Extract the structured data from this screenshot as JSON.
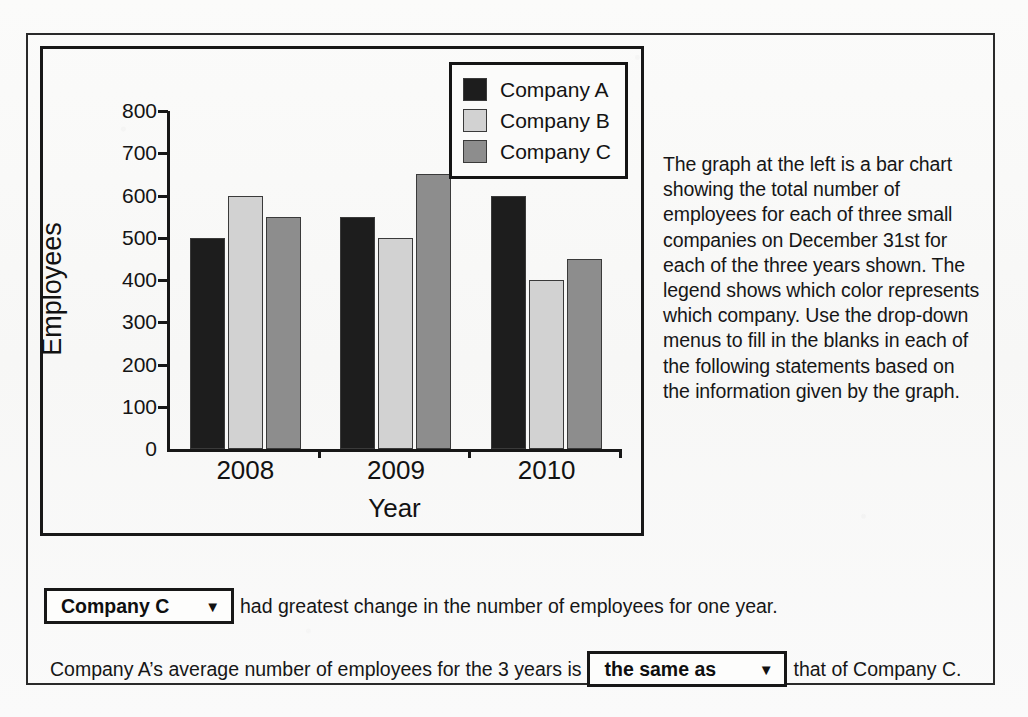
{
  "chart_data": {
    "type": "bar",
    "title": "",
    "xlabel": "Year",
    "ylabel": "Employees",
    "categories": [
      "2008",
      "2009",
      "2010"
    ],
    "series": [
      {
        "name": "Company A",
        "values": [
          500,
          550,
          600
        ],
        "color": "#1d1d1d"
      },
      {
        "name": "Company B",
        "values": [
          600,
          500,
          400
        ],
        "color": "#d2d2d2"
      },
      {
        "name": "Company C",
        "values": [
          550,
          650,
          450
        ],
        "color": "#8d8d8d"
      }
    ],
    "ylim": [
      0,
      800
    ],
    "yticks": [
      "0",
      "100",
      "200",
      "300",
      "400",
      "500",
      "600",
      "700",
      "800"
    ],
    "grid": false,
    "legend_position": "top-right"
  },
  "legend": {
    "items": [
      {
        "label": "Company A",
        "color": "#1d1d1d"
      },
      {
        "label": "Company B",
        "color": "#d2d2d2"
      },
      {
        "label": "Company C",
        "color": "#8d8d8d"
      }
    ]
  },
  "description": {
    "text": "The graph at the left is a bar chart showing the total number of employees for each of three small companies on December 31st for each of the three years shown. The legend shows which color represents which company. Use the drop-down menus to fill in the blanks in each of the following statements based on the information given by the graph."
  },
  "statements": [
    {
      "id": "statement-1",
      "leading_text": "",
      "dropdown_value": "Company C",
      "dropdown_arrow": "▼",
      "trailing_text": "had greatest change in the number of employees for one year."
    },
    {
      "id": "statement-2",
      "leading_text": "Company A’s average number of employees for the 3 years is",
      "dropdown_value": "the same as",
      "dropdown_arrow": "▼",
      "trailing_text": "that of Company C."
    }
  ]
}
